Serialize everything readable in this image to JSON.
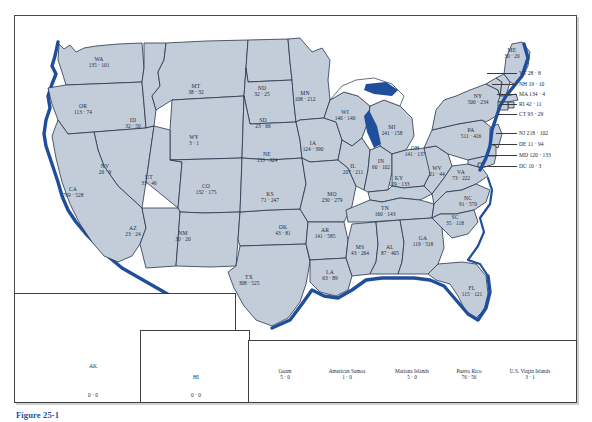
{
  "figure": {
    "caption": "Figure 25-1",
    "accent_color": "#1f4e9c",
    "land_color": "#c3cdd9",
    "border_color": "#26354d"
  },
  "map": {
    "type": "choropleth-annotated-us-map",
    "value_separator": "·",
    "states": [
      {
        "abbr": "WA",
        "values": "135 · 101",
        "x": 99,
        "y": 63
      },
      {
        "abbr": "OR",
        "values": "113 · 74",
        "x": 83,
        "y": 110
      },
      {
        "abbr": "ID",
        "values": "32 · 50",
        "x": 133,
        "y": 124
      },
      {
        "abbr": "MT",
        "values": "38 · 32",
        "x": 196,
        "y": 90
      },
      {
        "abbr": "ND",
        "values": "32 · 25",
        "x": 262,
        "y": 92
      },
      {
        "abbr": "SD",
        "values": "23 · 66",
        "x": 263,
        "y": 124
      },
      {
        "abbr": "WY",
        "values": "3 · 1",
        "x": 194,
        "y": 141
      },
      {
        "abbr": "NE",
        "values": "133 · 324",
        "x": 267,
        "y": 158
      },
      {
        "abbr": "NV",
        "values": "26 · 9",
        "x": 105,
        "y": 170
      },
      {
        "abbr": "UT",
        "values": "33 · 46",
        "x": 149,
        "y": 181
      },
      {
        "abbr": "CO",
        "values": "132 · 175",
        "x": 206,
        "y": 190
      },
      {
        "abbr": "KS",
        "values": "71 · 247",
        "x": 270,
        "y": 198
      },
      {
        "abbr": "CA",
        "values": "769 · 528",
        "x": 73,
        "y": 193
      },
      {
        "abbr": "AZ",
        "values": "23 · 24",
        "x": 133,
        "y": 232
      },
      {
        "abbr": "NM",
        "values": "30 · 20",
        "x": 183,
        "y": 237
      },
      {
        "abbr": "OK",
        "values": "43 · 81",
        "x": 283,
        "y": 231
      },
      {
        "abbr": "TX",
        "values": "308 · 525",
        "x": 249,
        "y": 281
      },
      {
        "abbr": "MN",
        "values": "108 · 212",
        "x": 305,
        "y": 97
      },
      {
        "abbr": "IA",
        "values": "124 · 390",
        "x": 313,
        "y": 147
      },
      {
        "abbr": "MO",
        "values": "230 · 279",
        "x": 332,
        "y": 198
      },
      {
        "abbr": "AR",
        "values": "141 · 585",
        "x": 325,
        "y": 234
      },
      {
        "abbr": "LA",
        "values": "63 · 89",
        "x": 330,
        "y": 276
      },
      {
        "abbr": "WI",
        "values": "146 · 140",
        "x": 345,
        "y": 116
      },
      {
        "abbr": "IL",
        "values": "207 · 211",
        "x": 353,
        "y": 170
      },
      {
        "abbr": "MS",
        "values": "43 · 264",
        "x": 360,
        "y": 251
      },
      {
        "abbr": "MI",
        "values": "241 · 158",
        "x": 392,
        "y": 131
      },
      {
        "abbr": "IN",
        "values": "60 · 102",
        "x": 381,
        "y": 165
      },
      {
        "abbr": "KY",
        "values": "129 · 133",
        "x": 399,
        "y": 182
      },
      {
        "abbr": "TN",
        "values": "160 · 143",
        "x": 385,
        "y": 212
      },
      {
        "abbr": "AL",
        "values": "87 · 405",
        "x": 390,
        "y": 251
      },
      {
        "abbr": "OH",
        "values": "141 · 137",
        "x": 415,
        "y": 152
      },
      {
        "abbr": "WV",
        "values": "21 · 44",
        "x": 437,
        "y": 172
      },
      {
        "abbr": "VA",
        "values": "73 · 222",
        "x": 461,
        "y": 176
      },
      {
        "abbr": "NC",
        "values": "91 · 570",
        "x": 468,
        "y": 202
      },
      {
        "abbr": "SC",
        "values": "35 · 118",
        "x": 455,
        "y": 221
      },
      {
        "abbr": "GA",
        "values": "119 · 518",
        "x": 423,
        "y": 242
      },
      {
        "abbr": "FL",
        "values": "115 · 121",
        "x": 472,
        "y": 292
      },
      {
        "abbr": "PA",
        "values": "511 · 416",
        "x": 471,
        "y": 134
      },
      {
        "abbr": "NY",
        "values": "500 · 234",
        "x": 478,
        "y": 100
      },
      {
        "abbr": "ME",
        "values": "30 · 20",
        "x": 512,
        "y": 54
      }
    ],
    "callouts": [
      {
        "label": "VT  28 · 8",
        "x": 519,
        "y": 73,
        "leader_from": 487,
        "leader_to": 517
      },
      {
        "label": "NH  19 · 10",
        "x": 519,
        "y": 84,
        "leader_from": 492,
        "leader_to": 517
      },
      {
        "label": "MA  134 · 4",
        "x": 519,
        "y": 94,
        "leader_from": 497,
        "leader_to": 517
      },
      {
        "label": "RI  42 · 11",
        "x": 519,
        "y": 104,
        "leader_from": 500,
        "leader_to": 517
      },
      {
        "label": "CT  93 · 29",
        "x": 519,
        "y": 114,
        "leader_from": 498,
        "leader_to": 517
      },
      {
        "label": "NJ  218 · 102",
        "x": 519,
        "y": 133,
        "leader_from": 496,
        "leader_to": 517
      },
      {
        "label": "DE  11 · 94",
        "x": 519,
        "y": 144,
        "leader_from": 492,
        "leader_to": 517
      },
      {
        "label": "MD  120 · 133",
        "x": 519,
        "y": 155,
        "leader_from": 488,
        "leader_to": 517
      },
      {
        "label": "DC  10 · 3",
        "x": 519,
        "y": 166,
        "leader_from": 484,
        "leader_to": 517
      }
    ],
    "insets": [
      {
        "abbr": "AK",
        "values": "0 · 0",
        "x": 93,
        "y": 367,
        "label_x": 93,
        "label_y": 396
      },
      {
        "abbr": "HI",
        "values": "0 · 0",
        "x": 196,
        "y": 378,
        "label_x": 196,
        "label_y": 396
      }
    ],
    "territories": [
      {
        "name": "Guam",
        "values": "5 · 0",
        "x": 285
      },
      {
        "name": "American Samoa",
        "values": "1 · 0",
        "x": 347
      },
      {
        "name": "Mariana Islands",
        "values": "5 · 0",
        "x": 412
      },
      {
        "name": "Puerto Rico",
        "values": "76 · 56",
        "x": 469
      },
      {
        "name": "U.S. Virgin Islands",
        "values": "3 · 1",
        "x": 530
      }
    ]
  }
}
